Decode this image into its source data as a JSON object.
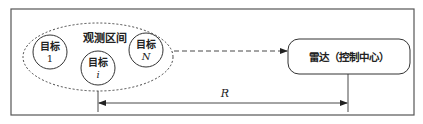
{
  "diagram": {
    "region_label": "观测区间",
    "targets": [
      {
        "label": "目标",
        "index": "1"
      },
      {
        "label": "目标",
        "index": "i"
      },
      {
        "label": "目标",
        "index": "N"
      }
    ],
    "radar_label": "雷达（控制中心）",
    "distance_label": "R"
  }
}
